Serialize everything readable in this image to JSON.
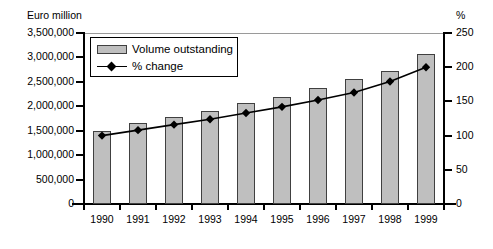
{
  "chart_data": {
    "type": "bar",
    "title": "",
    "categories": [
      "1990",
      "1991",
      "1992",
      "1993",
      "1994",
      "1995",
      "1996",
      "1997",
      "1998",
      "1999"
    ],
    "xlabel": "",
    "ylabel": "Euro million",
    "ylabel_right": "%",
    "ylim": [
      0,
      3500000
    ],
    "ylim_right": [
      0,
      250
    ],
    "yticks": [
      0,
      500000,
      1000000,
      1500000,
      2000000,
      2500000,
      3000000,
      3500000
    ],
    "ytick_labels": [
      "0",
      "500,000",
      "1,000,000",
      "1,500,000",
      "2,000,000",
      "2,500,000",
      "3,000,000",
      "3,500,000"
    ],
    "yticks_right": [
      0,
      50,
      100,
      150,
      200,
      250
    ],
    "ytick_labels_right": [
      "0",
      "50",
      "100",
      "150",
      "200",
      "250"
    ],
    "grid": "top-line-only",
    "legend_position": "upper-left-inside",
    "series": [
      {
        "name": "Volume outstanding",
        "type": "bar",
        "axis": "left",
        "color": "#bfbfbf",
        "edge_color": "#404040",
        "values": [
          1500000,
          1650000,
          1780000,
          1900000,
          2070000,
          2200000,
          2380000,
          2560000,
          2730000,
          3080000
        ]
      },
      {
        "name": "% change",
        "type": "line",
        "axis": "right",
        "color": "#000000",
        "marker": "diamond",
        "values": [
          100,
          108,
          116,
          124,
          133,
          142,
          152,
          163,
          179,
          200
        ]
      }
    ]
  },
  "legend": {
    "items": [
      {
        "label": "Volume outstanding",
        "icon": "bar-swatch"
      },
      {
        "label": "% change",
        "icon": "line-diamond-swatch"
      }
    ]
  },
  "colors": {
    "bar_fill": "#bfbfbf",
    "bar_edge": "#404040",
    "line": "#000000",
    "axis": "#000000",
    "gridline": "#9a9a9a",
    "background": "#ffffff"
  }
}
